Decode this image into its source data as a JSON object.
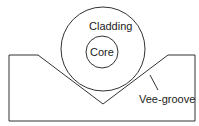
{
  "diagram": {
    "labels": {
      "cladding": "Cladding",
      "core": "Core",
      "groove": "Vee-groove"
    },
    "colors": {
      "stroke": "#333333",
      "background": "#ffffff"
    }
  }
}
